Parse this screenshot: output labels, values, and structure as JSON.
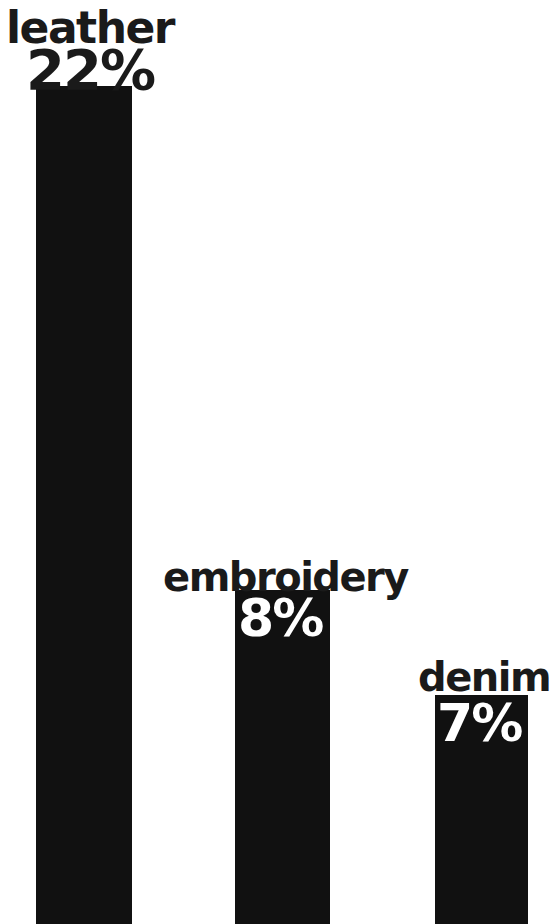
{
  "chart_data": {
    "type": "bar",
    "title": "",
    "subtitle": "",
    "xlabel": "",
    "ylabel": "",
    "categories": [
      "leather",
      "embroidery",
      "denim"
    ],
    "values": [
      22,
      8,
      7
    ],
    "value_labels": [
      "22%",
      "8%",
      "7%"
    ],
    "unit": "%",
    "ylim": [
      0,
      22
    ],
    "grid": false,
    "legend": null,
    "legend_position": "none",
    "orientation": "vertical",
    "annotations": [],
    "series": [
      {
        "name": "share",
        "values": [
          22,
          8,
          7
        ]
      }
    ]
  },
  "style": {
    "bar_color": "#111111",
    "background_color": "#ffffff",
    "category_label_color": "#1a1a1a",
    "value_label_color_on_bar": "#ffffff",
    "value_label_color_overlap": "#1a1a1a"
  },
  "bars": [
    {
      "category": "leather",
      "value": 22,
      "value_label": "22%"
    },
    {
      "category": "embroidery",
      "value": 8,
      "value_label": "8%"
    },
    {
      "category": "denim",
      "value": 7,
      "value_label": "7%"
    }
  ]
}
